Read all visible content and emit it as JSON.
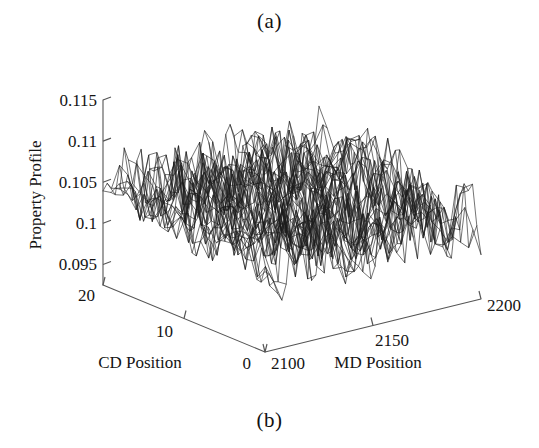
{
  "figure": {
    "panel_a_label": "(a)",
    "panel_b_label": "(b)",
    "background_color": "#ffffff",
    "line_color": "#1b1b1b",
    "axis_color": "#555555"
  },
  "chart_data": {
    "type": "line",
    "render_style": "3d-mesh-surface",
    "title": "",
    "subtitle": "",
    "zlabel": "Property Profile",
    "xlabel": "MD Position",
    "ylabel": "CD Position",
    "z_ticks": [
      "0.115",
      "0.11",
      "0.105",
      "0.1",
      "0.095"
    ],
    "z_tick_values": [
      0.115,
      0.11,
      0.105,
      0.1,
      0.095
    ],
    "zlim": [
      0.0925,
      0.115
    ],
    "x_ticks": [
      "2100",
      "2150",
      "2200"
    ],
    "x_tick_values": [
      2100,
      2150,
      2200
    ],
    "xlim": [
      2100,
      2200
    ],
    "y_ticks": [
      "0",
      "10",
      "20"
    ],
    "y_tick_values": [
      0,
      10,
      20
    ],
    "ylim": [
      0,
      20
    ],
    "grid": false,
    "legend": false,
    "legend_position": "none",
    "annotations": [
      "(a)",
      "(b)"
    ],
    "surface_description": "Dense noisy mesh of paper property profile over MD and CD position; values oscillate roughly between 0.094 and 0.112 about a mean near 0.102.",
    "mesh_nx": 52,
    "mesh_ny": 21,
    "value_mean": 0.1022,
    "value_noise_amplitude": 0.0068,
    "value_min": 0.0935,
    "value_max": 0.1122,
    "x": [
      2100,
      2102,
      2104,
      2106,
      2108,
      2110,
      2112,
      2114,
      2116,
      2118,
      2120,
      2122,
      2124,
      2126,
      2128,
      2130,
      2132,
      2134,
      2136,
      2138,
      2140,
      2142,
      2144,
      2146,
      2148,
      2150,
      2152,
      2154,
      2156,
      2158,
      2160,
      2162,
      2164,
      2166,
      2168,
      2170,
      2172,
      2174,
      2176,
      2178,
      2180,
      2182,
      2184,
      2186,
      2188,
      2190,
      2192,
      2194,
      2196,
      2198,
      2200
    ],
    "y": [
      0,
      1,
      2,
      3,
      4,
      5,
      6,
      7,
      8,
      9,
      10,
      11,
      12,
      13,
      14,
      15,
      16,
      17,
      18,
      19,
      20
    ]
  },
  "axis_titles": {
    "cd": "CD Position",
    "md": "MD Position",
    "property": "Property Profile"
  },
  "tick_labels": {
    "z": [
      "0.115",
      "0.11",
      "0.105",
      "0.1",
      "0.095"
    ],
    "cd": [
      "20",
      "10",
      "0"
    ],
    "md": [
      "2100",
      "2150",
      "2200"
    ]
  }
}
